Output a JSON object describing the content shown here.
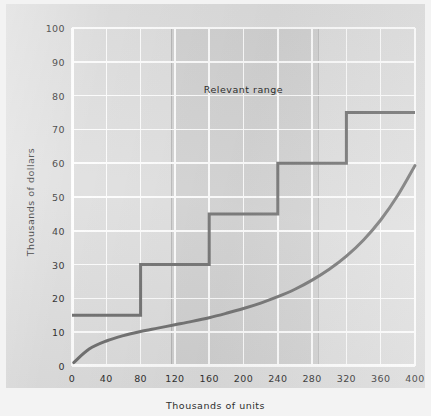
{
  "chart_data": {
    "type": "line",
    "title": "",
    "xlabel": "Thousands of units",
    "ylabel": "Thousands of dollars",
    "xlim": [
      0,
      400
    ],
    "ylim": [
      0,
      100
    ],
    "grid": true,
    "legend": false,
    "xticks": [
      0,
      40,
      80,
      120,
      160,
      200,
      240,
      280,
      320,
      360,
      400
    ],
    "yticks": [
      0,
      10,
      20,
      30,
      40,
      50,
      60,
      70,
      80,
      90,
      100
    ],
    "annotations": [
      {
        "text": "Relevant range",
        "x": 200,
        "y": 82
      }
    ],
    "shaded_regions": [
      {
        "label": "Relevant range",
        "x_start": 115,
        "y_start": 0,
        "x_end": 287,
        "y_end": 100
      }
    ],
    "series": [
      {
        "name": "Step fixed cost",
        "type": "step",
        "steps": [
          {
            "x_start": 0,
            "x_end": 80,
            "value": 15
          },
          {
            "x_start": 80,
            "x_end": 160,
            "value": 30
          },
          {
            "x_start": 160,
            "x_end": 240,
            "value": 45
          },
          {
            "x_start": 240,
            "x_end": 320,
            "value": 60
          },
          {
            "x_start": 320,
            "x_end": 400,
            "value": 75
          }
        ]
      },
      {
        "name": "Total variable cost",
        "type": "curve",
        "x": [
          2,
          20,
          40,
          60,
          80,
          100,
          120,
          140,
          160,
          180,
          200,
          220,
          240,
          260,
          280,
          300,
          320,
          340,
          360,
          380,
          400
        ],
        "y": [
          1.0,
          5.0,
          7.4,
          9.0,
          10.2,
          11.2,
          12.2,
          13.2,
          14.3,
          15.6,
          17.0,
          18.6,
          20.5,
          22.7,
          25.4,
          28.6,
          32.5,
          37.3,
          43.2,
          50.5,
          59.3
        ]
      }
    ]
  },
  "style": {
    "line_color": "#6f6f6f",
    "grid_color": "#fdfdfd",
    "panel_color": "#dedede",
    "band_color": "rgba(130,130,130,0.125)",
    "text_color": "#2e2e2e"
  }
}
